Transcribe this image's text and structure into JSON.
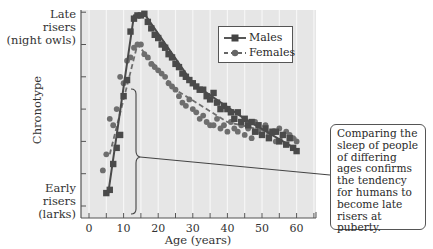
{
  "chart_data": {
    "type": "scatter",
    "title": "",
    "xlabel": "Age (years)",
    "ylabel": "Chronotype",
    "xlim": [
      -2.5,
      65.5
    ],
    "ylim": [
      -0.2,
      6.1
    ],
    "x_ticks": [
      0,
      10,
      20,
      30,
      40,
      50,
      60
    ],
    "y_tick_count": 7,
    "y_category_labels": {
      "top": [
        "Late",
        "risers",
        "(night owls)"
      ],
      "bottom": [
        "Early",
        "risers",
        "(larks)"
      ]
    },
    "grid": "vertical",
    "legend": {
      "position": "upper-right-inside",
      "entries": [
        "Males",
        "Females"
      ]
    },
    "series": [
      {
        "name": "Males",
        "marker": "square",
        "line": "solid",
        "x": [
          5,
          6,
          7,
          8,
          9,
          10,
          11,
          12,
          13,
          14,
          15,
          16,
          17,
          18,
          19,
          20,
          21,
          22,
          23,
          24,
          25,
          26,
          27,
          28,
          29,
          30,
          31,
          32,
          33,
          34,
          35,
          36,
          37,
          38,
          39,
          40,
          41,
          42,
          43,
          44,
          45,
          46,
          47,
          48,
          49,
          50,
          51,
          52,
          53,
          54,
          55,
          56,
          57,
          58,
          59,
          60
        ],
        "values": [
          0.4,
          0.5,
          1.3,
          1.8,
          2.2,
          3.4,
          3.9,
          5.4,
          5.8,
          5.9,
          5.9,
          5.95,
          5.7,
          5.5,
          5.3,
          5.2,
          5.0,
          4.9,
          4.7,
          4.6,
          4.4,
          4.3,
          4.1,
          4.0,
          3.9,
          3.8,
          3.7,
          3.6,
          3.6,
          3.4,
          3.3,
          3.5,
          3.2,
          3.0,
          3.1,
          3.0,
          2.9,
          2.7,
          2.9,
          2.6,
          2.7,
          2.5,
          2.6,
          2.3,
          2.5,
          2.2,
          2.4,
          2.1,
          2.3,
          2.3,
          2.0,
          2.2,
          1.9,
          2.1,
          1.8,
          1.7
        ]
      },
      {
        "name": "Females",
        "marker": "circle",
        "line": "dashed",
        "x": [
          4,
          5,
          6,
          7,
          8,
          9,
          10,
          11,
          12,
          13,
          14,
          15,
          16,
          17,
          18,
          19,
          20,
          21,
          22,
          23,
          24,
          25,
          26,
          27,
          28,
          29,
          30,
          31,
          32,
          33,
          34,
          35,
          36,
          37,
          38,
          39,
          40,
          41,
          42,
          43,
          44,
          45,
          46,
          47,
          48,
          49,
          50,
          51,
          52,
          53,
          54,
          55,
          56,
          57,
          58,
          59,
          60
        ],
        "values": [
          1.1,
          1.6,
          2.7,
          2.5,
          3.0,
          4.0,
          3.8,
          4.5,
          4.6,
          4.9,
          5.0,
          5.0,
          4.7,
          4.6,
          4.4,
          4.3,
          4.2,
          4.1,
          4.0,
          3.8,
          3.7,
          3.6,
          3.4,
          3.2,
          3.1,
          3.3,
          3.0,
          2.9,
          2.7,
          2.8,
          2.6,
          2.5,
          2.5,
          2.7,
          2.4,
          2.5,
          2.3,
          2.6,
          2.4,
          2.3,
          2.5,
          2.2,
          2.4,
          2.1,
          2.6,
          2.3,
          2.2,
          2.5,
          2.2,
          2.3,
          2.0,
          2.4,
          2.2,
          2.3,
          2.2,
          2.1,
          2.0
        ]
      }
    ],
    "annotation": "Comparing the sleep of people of differing ages confirms the tendency for humans to become late risers at puberty."
  },
  "axis": {
    "ylabel": "Chronotype",
    "xlabel": "Age (years)",
    "top_label_lines": [
      "Late",
      "risers",
      "(night owls)"
    ],
    "bottom_label_lines": [
      "Early",
      "risers",
      "(larks)"
    ]
  },
  "legend": {
    "males": "Males",
    "females": "Females"
  },
  "callout": {
    "text": "Comparing the sleep of people of differing ages confirms the tendency for humans to become late risers at puberty."
  },
  "colors": {
    "plot_bg": "#e6e6e6",
    "grid": "#f6f6f6",
    "males": "#4a4a4a",
    "females": "#6e6e6e",
    "frame": "#555555"
  }
}
